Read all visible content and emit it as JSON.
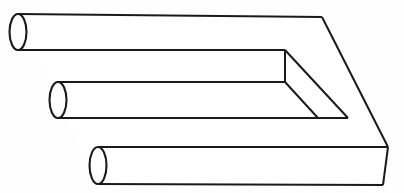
{
  "figure": {
    "title": "Impossible Trident",
    "alt_names": "blivet, devil's fork, poiuyt",
    "type": "optical-illusion-line-drawing",
    "background_color": "#fefefe",
    "line_color": "#1a1a1a",
    "fill_color": "#ffffff",
    "line_width_px": 2,
    "canvas": {
      "width": 404,
      "height": 193
    },
    "orientation": "prongs-point-left, solid-block-right",
    "prong_count_left": 3,
    "prong_count_right": 2,
    "parts": [
      {
        "id": "prong-top",
        "label": "Top cylindrical prong",
        "shape": "cylinder",
        "cap_center": {
          "x": 18,
          "y": 32
        },
        "cap_rx": 8,
        "cap_ry": 18,
        "top_edge_y": 14,
        "bottom_edge_y": 50,
        "extends_to_x": 322
      },
      {
        "id": "prong-middle",
        "label": "Middle cylindrical prong",
        "shape": "cylinder",
        "cap_center": {
          "x": 58,
          "y": 100
        },
        "cap_rx": 8,
        "cap_ry": 18,
        "top_edge_y": 82,
        "bottom_edge_y": 118,
        "extends_to_x": 318
      },
      {
        "id": "prong-bottom",
        "label": "Bottom cylindrical prong",
        "shape": "cylinder",
        "cap_center": {
          "x": 98,
          "y": 165
        },
        "cap_rx": 8,
        "cap_ry": 19,
        "top_edge_y": 147,
        "bottom_edge_y": 184,
        "extends_to_x": 388
      },
      {
        "id": "block-body",
        "label": "Rectangular block body",
        "shape": "prism",
        "top_right_corner": {
          "x": 322,
          "y": 17
        },
        "right_vertex": {
          "x": 388,
          "y": 147
        },
        "bottom_right_corner": {
          "x": 383,
          "y": 185
        }
      },
      {
        "id": "inner-notch",
        "label": "Inner notch between upper prongs",
        "shape": "wedge",
        "vertical_edge_x": 285,
        "vertical_edge_top_y": 50,
        "vertical_edge_bottom_y": 82
      }
    ]
  },
  "annotations": {
    "caption": "",
    "credit": ""
  }
}
